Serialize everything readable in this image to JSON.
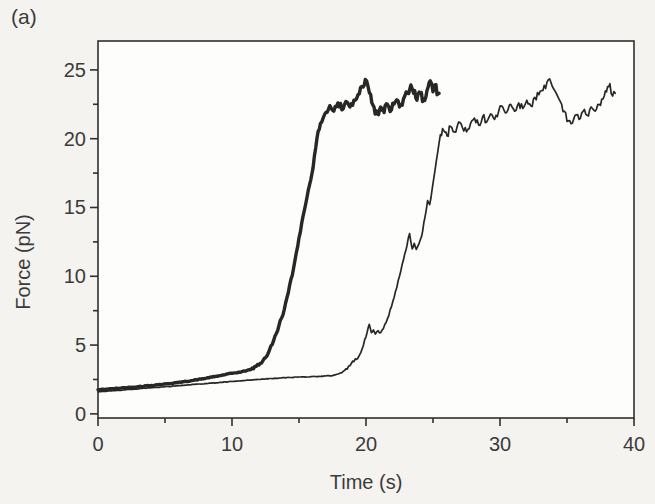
{
  "panel_label": "(a)",
  "colors": {
    "curve": "#272727",
    "axis": "#2f2f2f",
    "text": "#3b3b3b",
    "page_background": "#f4f3f0",
    "plot_background": "#fdfdfc"
  },
  "chart_data": {
    "type": "line",
    "title": "",
    "xlabel": "Time (s)",
    "ylabel": "Force (pN)",
    "xlim": [
      0,
      40
    ],
    "ylim": [
      -0.3,
      27.1
    ],
    "x_major_ticks": [
      0,
      10,
      20,
      30,
      40
    ],
    "x_minor_ticks": [
      5,
      15,
      25,
      35
    ],
    "y_major_ticks": [
      0,
      5,
      10,
      15,
      20,
      25
    ],
    "y_minor_ticks": [
      2.5,
      7.5,
      12.5,
      17.5,
      22.5
    ],
    "grid": false,
    "legend": false,
    "series": [
      {
        "name": "thick-trace",
        "stroke_width": 3.4,
        "noise": [
          {
            "from": 0,
            "to": 11.5,
            "amp": 0.03
          },
          {
            "from": 11.5,
            "to": 16.8,
            "amp": 0.12
          },
          {
            "from": 16.8,
            "to": 25.45,
            "amp": 0.38
          }
        ],
        "points": [
          [
            0,
            1.75
          ],
          [
            1,
            1.82
          ],
          [
            2,
            1.9
          ],
          [
            3,
            1.98
          ],
          [
            4,
            2.07
          ],
          [
            5,
            2.17
          ],
          [
            6,
            2.28
          ],
          [
            7,
            2.42
          ],
          [
            8,
            2.58
          ],
          [
            9,
            2.76
          ],
          [
            10,
            2.95
          ],
          [
            10.7,
            3.05
          ],
          [
            11.3,
            3.2
          ],
          [
            11.8,
            3.45
          ],
          [
            12.3,
            3.85
          ],
          [
            12.7,
            4.4
          ],
          [
            13.1,
            5.3
          ],
          [
            13.5,
            6.4
          ],
          [
            13.9,
            7.6
          ],
          [
            14.2,
            8.8
          ],
          [
            14.6,
            10.6
          ],
          [
            15,
            12.8
          ],
          [
            15.4,
            14.8
          ],
          [
            15.7,
            16.3
          ],
          [
            16.05,
            17.9
          ],
          [
            16.35,
            20.1
          ],
          [
            16.6,
            21.1
          ],
          [
            16.8,
            21.5
          ],
          [
            17,
            21.9
          ],
          [
            17.3,
            22.4
          ],
          [
            17.6,
            22
          ],
          [
            17.9,
            22.6
          ],
          [
            18.2,
            22.1
          ],
          [
            18.5,
            22.7
          ],
          [
            18.8,
            22.3
          ],
          [
            19.1,
            22.8
          ],
          [
            19.4,
            23.2
          ],
          [
            19.7,
            23.8
          ],
          [
            19.95,
            24.3
          ],
          [
            20.15,
            23.8
          ],
          [
            20.35,
            23.2
          ],
          [
            20.6,
            22.3
          ],
          [
            20.85,
            21.8
          ],
          [
            21.1,
            22.3
          ],
          [
            21.35,
            21.9
          ],
          [
            21.6,
            22.5
          ],
          [
            21.9,
            22.1
          ],
          [
            22.2,
            22.7
          ],
          [
            22.5,
            22.3
          ],
          [
            22.8,
            22.9
          ],
          [
            23.1,
            23.3
          ],
          [
            23.35,
            23.9
          ],
          [
            23.55,
            23.3
          ],
          [
            23.8,
            22.8
          ],
          [
            24.05,
            23.3
          ],
          [
            24.3,
            22.9
          ],
          [
            24.55,
            23.5
          ],
          [
            24.8,
            24.2
          ],
          [
            25,
            23.4
          ],
          [
            25.15,
            23.9
          ],
          [
            25.3,
            23.2
          ],
          [
            25.45,
            23.3
          ]
        ]
      },
      {
        "name": "thin-trace",
        "stroke_width": 1.7,
        "noise": [
          {
            "from": 0,
            "to": 18.2,
            "amp": 0.02
          },
          {
            "from": 18.2,
            "to": 25.55,
            "amp": 0.1
          },
          {
            "from": 25.55,
            "to": 38.6,
            "amp": 0.28
          }
        ],
        "points": [
          [
            0,
            1.6
          ],
          [
            2,
            1.75
          ],
          [
            4,
            1.9
          ],
          [
            6,
            2.05
          ],
          [
            8,
            2.2
          ],
          [
            10,
            2.35
          ],
          [
            12,
            2.5
          ],
          [
            13.5,
            2.6
          ],
          [
            15,
            2.68
          ],
          [
            16.5,
            2.72
          ],
          [
            17.5,
            2.78
          ],
          [
            18.2,
            3
          ],
          [
            18.8,
            3.5
          ],
          [
            19.2,
            4
          ],
          [
            19.45,
            4.15
          ],
          [
            19.7,
            4.7
          ],
          [
            20,
            5.6
          ],
          [
            20.25,
            6.5
          ],
          [
            20.4,
            5.9
          ],
          [
            20.55,
            6.1
          ],
          [
            20.7,
            5.8
          ],
          [
            20.9,
            6.05
          ],
          [
            21.1,
            5.9
          ],
          [
            21.3,
            6.2
          ],
          [
            21.6,
            6.9
          ],
          [
            21.9,
            7.8
          ],
          [
            22.2,
            8.9
          ],
          [
            22.5,
            10
          ],
          [
            22.8,
            11.2
          ],
          [
            23.05,
            12.2
          ],
          [
            23.25,
            13.1
          ],
          [
            23.45,
            12
          ],
          [
            23.6,
            12.4
          ],
          [
            23.75,
            11.95
          ],
          [
            23.95,
            12.35
          ],
          [
            24.15,
            12.9
          ],
          [
            24.4,
            14.3
          ],
          [
            24.6,
            15.5
          ],
          [
            24.75,
            15.2
          ],
          [
            24.95,
            16.4
          ],
          [
            25.15,
            17.7
          ],
          [
            25.35,
            19
          ],
          [
            25.55,
            20.3
          ],
          [
            25.8,
            20.6
          ],
          [
            26.05,
            20.2
          ],
          [
            26.3,
            20.9
          ],
          [
            26.6,
            20.5
          ],
          [
            26.9,
            21.2
          ],
          [
            27.2,
            20.8
          ],
          [
            27.5,
            20.5
          ],
          [
            27.8,
            21.1
          ],
          [
            28.1,
            21.5
          ],
          [
            28.4,
            21
          ],
          [
            28.7,
            21.6
          ],
          [
            29,
            21.2
          ],
          [
            29.3,
            21.8
          ],
          [
            29.6,
            21.4
          ],
          [
            29.9,
            22
          ],
          [
            30.2,
            22.3
          ],
          [
            30.5,
            21.9
          ],
          [
            30.8,
            22.5
          ],
          [
            31.1,
            22
          ],
          [
            31.4,
            22.6
          ],
          [
            31.7,
            22.2
          ],
          [
            32,
            22.8
          ],
          [
            32.3,
            22.4
          ],
          [
            32.6,
            23
          ],
          [
            32.9,
            23.2
          ],
          [
            33.2,
            23.5
          ],
          [
            33.5,
            24.1
          ],
          [
            33.7,
            24.35
          ],
          [
            33.9,
            23.8
          ],
          [
            34.2,
            23.3
          ],
          [
            34.5,
            22.7
          ],
          [
            34.8,
            22
          ],
          [
            35.1,
            21.3
          ],
          [
            35.3,
            21.1
          ],
          [
            35.6,
            21.7
          ],
          [
            35.9,
            21.4
          ],
          [
            36.2,
            22
          ],
          [
            36.5,
            21.7
          ],
          [
            36.8,
            22.3
          ],
          [
            37.1,
            22
          ],
          [
            37.4,
            22.5
          ],
          [
            37.7,
            22.9
          ],
          [
            37.95,
            23.4
          ],
          [
            38.2,
            24
          ],
          [
            38.4,
            23.1
          ],
          [
            38.6,
            23.3
          ]
        ]
      }
    ]
  }
}
